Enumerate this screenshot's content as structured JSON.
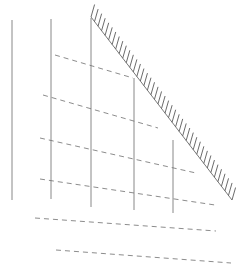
{
  "document": {
    "title": "Hatched Slope Line Drawing",
    "kind": "technical-line-drawing",
    "width": 236,
    "height": 273,
    "background_color": "#ffffff"
  },
  "style": {
    "solid_line_color": "#7a7a7a",
    "dashed_line_color": "#6e6e6e",
    "hatch_line_color": "#5a5a5a",
    "slope_line_color": "#6a6a6a",
    "solid_line_width": 0.9,
    "dashed_line_width": 0.8,
    "hatch_line_width": 0.9,
    "slope_line_width": 0.9,
    "dash_pattern": "5 4"
  },
  "geometry": {
    "vertical_lines": [
      {
        "name": "vertical-line-1",
        "x1": 12,
        "y1": 20,
        "x2": 12,
        "y2": 200
      },
      {
        "name": "vertical-line-2",
        "x1": 51,
        "y1": 19,
        "x2": 51,
        "y2": 199
      },
      {
        "name": "vertical-line-3",
        "x1": 91,
        "y1": 18,
        "x2": 91,
        "y2": 207
      },
      {
        "name": "vertical-line-4",
        "x1": 134,
        "y1": 78,
        "x2": 134,
        "y2": 210
      },
      {
        "name": "vertical-line-5",
        "x1": 173,
        "y1": 140,
        "x2": 173,
        "y2": 213
      }
    ],
    "dashed_lines": [
      {
        "name": "dashed-line-1",
        "x1": 55,
        "y1": 55,
        "x2": 133,
        "y2": 78
      },
      {
        "name": "dashed-line-2",
        "x1": 43,
        "y1": 95,
        "x2": 158,
        "y2": 128
      },
      {
        "name": "dashed-line-3",
        "x1": 40,
        "y1": 138,
        "x2": 196,
        "y2": 173
      },
      {
        "name": "dashed-line-4",
        "x1": 40,
        "y1": 179,
        "x2": 215,
        "y2": 205
      },
      {
        "name": "dashed-line-5",
        "x1": 35,
        "y1": 218,
        "x2": 216,
        "y2": 231
      },
      {
        "name": "dashed-line-6",
        "x1": 56,
        "y1": 250,
        "x2": 231,
        "y2": 263
      }
    ],
    "hatched_slope": {
      "name": "hatched-slope-line",
      "x1": 91,
      "y1": 17,
      "x2": 232,
      "y2": 200,
      "tick_count": 41,
      "tick_length": 13,
      "tick_angle_deg": 74,
      "tick_side": "upper-right"
    }
  }
}
